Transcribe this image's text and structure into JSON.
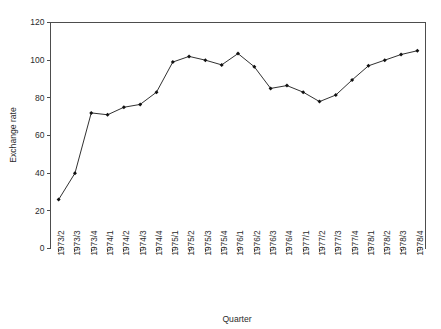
{
  "chart_data": {
    "type": "line",
    "title": "",
    "xlabel": "Quarter",
    "ylabel": "Exchange rate",
    "ylim": [
      0,
      120
    ],
    "ytick_values": [
      0,
      20,
      40,
      60,
      80,
      100,
      120
    ],
    "ytick_labels": [
      "0",
      "20",
      "40",
      "60",
      "80",
      "100",
      "120"
    ],
    "grid": false,
    "legend": false,
    "legend_position": "none",
    "marker": "filled-diamond",
    "line_color": "#1a1a1a",
    "marker_color": "#111111",
    "categories": [
      "1973/2",
      "1973/3",
      "1973/4",
      "1974/1",
      "1974/2",
      "1974/3",
      "1974/4",
      "1975/1",
      "1975/2",
      "1975/3",
      "1975/4",
      "1976/1",
      "1976/2",
      "1976/3",
      "1976/4",
      "1977/1",
      "1977/2",
      "1977/3",
      "1977/4",
      "1978/1",
      "1978/2",
      "1978/3",
      "1978/4"
    ],
    "values": [
      26,
      40,
      72,
      71,
      75,
      76.5,
      83,
      99,
      102,
      100,
      97.5,
      103.5,
      96.5,
      85,
      86.5,
      83,
      78,
      81.5,
      89.5,
      97,
      100,
      103,
      105
    ]
  }
}
